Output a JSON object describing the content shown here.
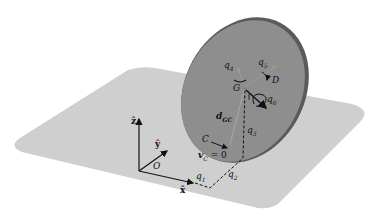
{
  "figure": {
    "colors": {
      "plane": "#cfcfcf",
      "disk_face": "#8e8e8e",
      "disk_rim": "#5a5a5a",
      "axes": "#111111",
      "dashed": "#111111",
      "thin_arrows": "#9a9a9a"
    },
    "labels": {
      "z_axis": "ẑ",
      "y_axis": "ŷ",
      "x_axis": "x̂",
      "origin": "O",
      "q1": "q",
      "q1_sub": "1",
      "q2": "q",
      "q2_sub": "2",
      "q3": "q",
      "q3_sub": "3",
      "q4": "q",
      "q4_sub": "4",
      "q5": "q",
      "q5_sub": "5",
      "q6": "q",
      "q6_sub": "6",
      "center": "G",
      "disk": "D",
      "contact": "C",
      "d_vec": "d",
      "d_sub": "GC",
      "v_contact": "v",
      "v_sub": "C",
      "v_eq": " = 0"
    }
  }
}
